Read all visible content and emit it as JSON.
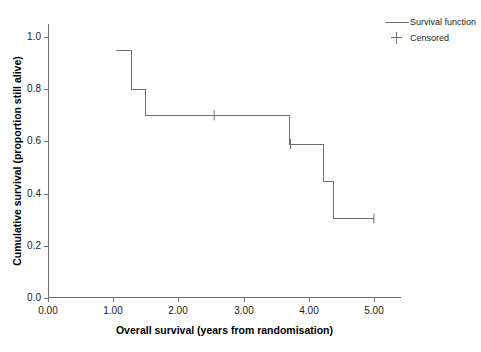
{
  "chart_data": {
    "type": "line",
    "title": "",
    "xlabel": "Overall survival (years from randomisation)",
    "ylabel": "Cumulative survival (proportion still alive)",
    "xlim": [
      0.0,
      5.4
    ],
    "ylim": [
      0.0,
      1.05
    ],
    "xticks": [
      "0.00",
      "1.00",
      "2.00",
      "3.00",
      "4.00",
      "5.00"
    ],
    "xtick_values": [
      0.0,
      1.0,
      2.0,
      3.0,
      4.0,
      5.0
    ],
    "yticks": [
      "0.0",
      "0.2",
      "0.4",
      "0.6",
      "0.8",
      "1.0"
    ],
    "ytick_values": [
      0.0,
      0.2,
      0.4,
      0.6,
      0.8,
      1.0
    ],
    "grid": false,
    "legend_position": "top-right",
    "legend": [
      {
        "label": "Survival function",
        "marker": "line"
      },
      {
        "label": "Censored",
        "marker": "plus"
      }
    ],
    "series": [
      {
        "name": "Survival function",
        "style": "step",
        "color": "#6f6f6f",
        "points": [
          {
            "x": 1.05,
            "y": 0.95
          },
          {
            "x": 1.28,
            "y": 0.95
          },
          {
            "x": 1.28,
            "y": 0.8
          },
          {
            "x": 1.5,
            "y": 0.8
          },
          {
            "x": 1.5,
            "y": 0.7
          },
          {
            "x": 3.7,
            "y": 0.7
          },
          {
            "x": 3.7,
            "y": 0.59
          },
          {
            "x": 4.22,
            "y": 0.59
          },
          {
            "x": 4.22,
            "y": 0.445
          },
          {
            "x": 4.38,
            "y": 0.445
          },
          {
            "x": 4.38,
            "y": 0.305
          },
          {
            "x": 5.0,
            "y": 0.305
          }
        ]
      },
      {
        "name": "Censored",
        "style": "marker",
        "marker": "plus",
        "color": "#6f6f6f",
        "points": [
          {
            "x": 2.55,
            "y": 0.7
          },
          {
            "x": 3.72,
            "y": 0.59
          },
          {
            "x": 5.0,
            "y": 0.305
          }
        ]
      }
    ]
  }
}
